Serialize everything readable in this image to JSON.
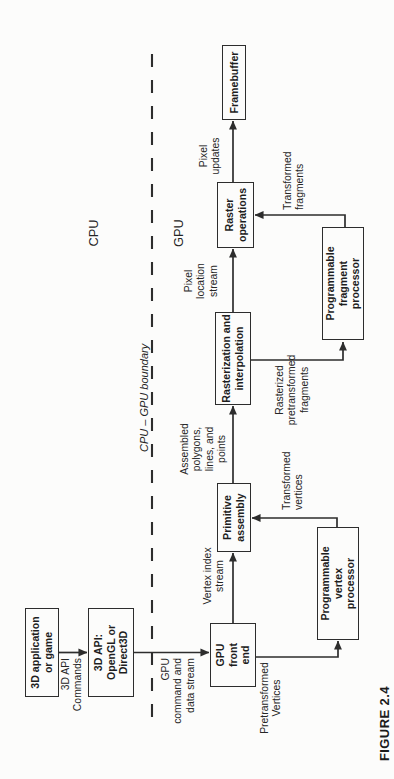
{
  "figure": {
    "caption": "FIGURE 2.4",
    "zones": {
      "cpu": "CPU",
      "gpu": "GPU",
      "boundary": "CPU – GPU boundary"
    },
    "nodes": {
      "app": "3D application\nor game",
      "api": "3D API:\nOpenGL or\nDirect3D",
      "frontend": "GPU\nfront\nend",
      "primitive": "Primitive\nassembly",
      "raster": "Rasterization and\ninterpolation",
      "rop": "Raster\noperations",
      "framebuffer": "Framebuffer",
      "vertex": "Programmable\nvertex\nprocessor",
      "fragment": "Programmable\nfragment\nprocessor"
    },
    "flows": {
      "api_commands": "3D API\nCommands",
      "gpu_stream": "GPU\ncommand and\ndata stream",
      "vertex_index": "Vertex index\nstream",
      "assembled": "Assembled\npolygons,\nlines, and\npoints",
      "pixel_location": "Pixel\nlocation\nstream",
      "pixel_updates": "Pixel\nupdates",
      "pretransformed": "Pretransformed\nVertices",
      "transformed_vertices": "Transformed\nvertices",
      "rasterized": "Rasterized\npretransformed\nfragments",
      "transformed_fragments": "Transformed\nfragments"
    },
    "line_color": "#2d2d2d"
  }
}
